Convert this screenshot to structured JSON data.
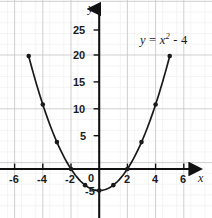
{
  "figure": {
    "title": "",
    "background_color": "#ffffff",
    "curve_color": "#1a1a1a",
    "axis_color": "#111111",
    "grid_major_color": "#c9c9c9",
    "grid_minor_color": "#ededed",
    "point_color": "#1a1a1a"
  },
  "equation_label": {
    "full_text": "y = x² - 4",
    "lhs": "y",
    "equals": " = ",
    "base": "x",
    "exponent": "2",
    "operator": " - ",
    "constant": "4"
  },
  "axes": {
    "x_name": "x",
    "y_name": "y",
    "x_ticks": [
      "-6",
      "-4",
      "-2",
      "0",
      "2",
      "4",
      "6"
    ],
    "y_ticks": [
      "25",
      "20",
      "15",
      "10",
      "5",
      "-5"
    ],
    "origin_label": "0"
  },
  "chart_data": {
    "type": "line",
    "title": "",
    "subtitle": "",
    "xlabel": "x",
    "ylabel": "y",
    "equation": "y = x^2 - 4",
    "xlim": [
      -7.2,
      7.0
    ],
    "ylim": [
      -7.0,
      27.5
    ],
    "xticks": [
      -6,
      -4,
      -2,
      0,
      2,
      4,
      6
    ],
    "yticks": [
      -5,
      0,
      5,
      10,
      15,
      20,
      25
    ],
    "xtick_labels": [
      "-6",
      "-4",
      "-2",
      "0",
      "2",
      "4",
      "6"
    ],
    "ytick_labels": [
      "-5",
      "0",
      "5",
      "10",
      "15",
      "20",
      "25"
    ],
    "grid": true,
    "grid_major_x_step": 2,
    "grid_major_y_step": 5,
    "grid_minor_x_step": 1,
    "grid_minor_y_step": 1,
    "legend": null,
    "annotations": [
      {
        "text": "y = x² - 4",
        "x": 3.6,
        "y": 23.5
      }
    ],
    "series": [
      {
        "name": "y = x^2 - 4",
        "marker": "filled-circle",
        "x": [
          -5,
          -4,
          -3,
          -2,
          -1,
          0,
          1,
          2,
          3,
          4,
          5
        ],
        "values": [
          21,
          12,
          5,
          0,
          -3,
          -4,
          -3,
          0,
          5,
          12,
          21
        ]
      }
    ],
    "roots": [
      -2,
      2
    ],
    "vertex": [
      0,
      -4
    ]
  }
}
